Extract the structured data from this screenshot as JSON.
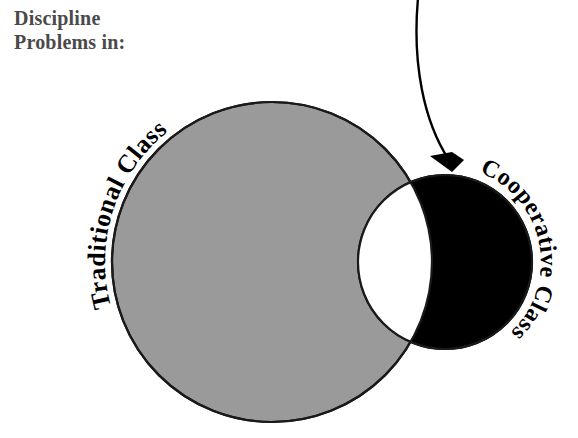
{
  "figure": {
    "type": "venn-diagram",
    "background_color": "#ffffff",
    "title_lines": [
      "Discipline",
      "Problems in:"
    ],
    "title_color": "#4a4a4a",
    "labels": {
      "left_circle": "Traditional Class",
      "right_circle": "Cooperative Class"
    },
    "label_color": "#000000",
    "circles": [
      {
        "name": "traditional-class-circle",
        "label": "Traditional Class",
        "fill_color": "#9a9a9a",
        "stroke_color": "#1a1a1a",
        "cx": 272,
        "cy": 262,
        "r": 160
      },
      {
        "name": "cooperative-class-circle",
        "label": "Cooperative Class",
        "fill_color": "#000000",
        "stroke_color": "#000000",
        "cx": 445,
        "cy": 262,
        "r": 87
      }
    ],
    "overlap": {
      "name": "overlap-region",
      "fill_color": "#ffffff",
      "stroke_color": "#1a1a1a"
    },
    "annotation_arrow": {
      "name": "pointer-arrow",
      "color": "#000000",
      "from": [
        418,
        0
      ],
      "to": [
        452,
        168
      ],
      "target": "cooperative-class-circle"
    }
  }
}
